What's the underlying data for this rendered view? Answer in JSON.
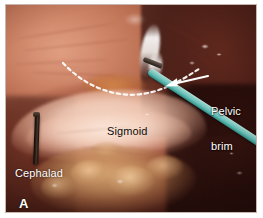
{
  "figure": {
    "panel_letter": "A",
    "modality": "laparoscopic-photograph",
    "background_color": "#ffffff",
    "frame_border_color": "#c8b5ad"
  },
  "annotations": {
    "pelvic_brim": {
      "line1": "Pelvic",
      "line2": "brim",
      "color": "#ffffff",
      "has_arrow": true,
      "arrow_color": "#ffffff",
      "arrow_direction": "left-down"
    },
    "sigmoid": {
      "label": "Sigmoid",
      "color": "#0d0d0d"
    },
    "cephalad": {
      "label": "Cephalad",
      "color": "#ffffff"
    },
    "panel_label": {
      "label": "A",
      "color": "#ffffff"
    }
  },
  "scene": {
    "instruments": [
      {
        "name": "teal-laparoscopic-grasper",
        "color": "#6ec3bb",
        "position": "upper-right-diagonal"
      },
      {
        "name": "dark-probe",
        "color": "#2a1d16",
        "position": "left-vertical"
      }
    ],
    "tissue_regions": [
      {
        "name": "peritoneum-upper-left",
        "color": "#ce8568"
      },
      {
        "name": "pelvic-sidewall-right",
        "color": "#5c261c"
      },
      {
        "name": "sigmoid-colon-band",
        "color": "#f3cdb9"
      },
      {
        "name": "mesenteric-fat-lower",
        "color": "#cf9a66"
      }
    ],
    "markings": [
      {
        "name": "dashed-demarcation-line",
        "color": "#ffffff",
        "style": "dashed"
      }
    ]
  }
}
